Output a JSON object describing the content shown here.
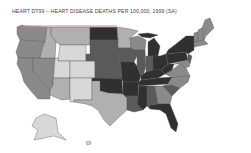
{
  "title": "HEART DT99 – HEART DISEASE DEATHS PER 100,000, 1999 (SA)",
  "map": {
    "region": "United States",
    "metric": "Heart disease deaths per 100,000",
    "year": 1999,
    "shade_scale": [
      "#d8d8d8",
      "#b0b0b0",
      "#8a8a8a",
      "#5a5a5a",
      "#303030"
    ],
    "states": [
      {
        "name": "Washington",
        "shade": 2
      },
      {
        "name": "Oregon",
        "shade": 2
      },
      {
        "name": "California",
        "shade": 2
      },
      {
        "name": "Nevada",
        "shade": 2
      },
      {
        "name": "Idaho",
        "shade": 1
      },
      {
        "name": "Montana",
        "shade": 1
      },
      {
        "name": "Wyoming",
        "shade": 0
      },
      {
        "name": "Utah",
        "shade": 0
      },
      {
        "name": "Arizona",
        "shade": 1
      },
      {
        "name": "Colorado",
        "shade": 0
      },
      {
        "name": "New Mexico",
        "shade": 0
      },
      {
        "name": "North Dakota",
        "shade": 4
      },
      {
        "name": "South Dakota",
        "shade": 3
      },
      {
        "name": "Nebraska",
        "shade": 3
      },
      {
        "name": "Kansas",
        "shade": 3
      },
      {
        "name": "Oklahoma",
        "shade": 4
      },
      {
        "name": "Texas",
        "shade": 1
      },
      {
        "name": "Minnesota",
        "shade": 1
      },
      {
        "name": "Iowa",
        "shade": 3
      },
      {
        "name": "Missouri",
        "shade": 4
      },
      {
        "name": "Arkansas",
        "shade": 4
      },
      {
        "name": "Louisiana",
        "shade": 3
      },
      {
        "name": "Wisconsin",
        "shade": 2
      },
      {
        "name": "Illinois",
        "shade": 3
      },
      {
        "name": "Michigan",
        "shade": 4
      },
      {
        "name": "Indiana",
        "shade": 3
      },
      {
        "name": "Ohio",
        "shade": 4
      },
      {
        "name": "Kentucky",
        "shade": 4
      },
      {
        "name": "Tennessee",
        "shade": 4
      },
      {
        "name": "Mississippi",
        "shade": 4
      },
      {
        "name": "Alabama",
        "shade": 3
      },
      {
        "name": "Georgia",
        "shade": 2
      },
      {
        "name": "Florida",
        "shade": 4
      },
      {
        "name": "South Carolina",
        "shade": 3
      },
      {
        "name": "North Carolina",
        "shade": 2
      },
      {
        "name": "Virginia",
        "shade": 2
      },
      {
        "name": "West Virginia",
        "shade": 4
      },
      {
        "name": "Pennsylvania",
        "shade": 4
      },
      {
        "name": "New York",
        "shade": 4
      },
      {
        "name": "Vermont",
        "shade": 2
      },
      {
        "name": "New Hampshire",
        "shade": 2
      },
      {
        "name": "Maine",
        "shade": 2
      },
      {
        "name": "Massachusetts",
        "shade": 2
      },
      {
        "name": "New Jersey",
        "shade": 3
      },
      {
        "name": "Maryland",
        "shade": 2
      },
      {
        "name": "Alaska",
        "shade": 0
      },
      {
        "name": "Hawaii",
        "shade": 0
      }
    ]
  }
}
